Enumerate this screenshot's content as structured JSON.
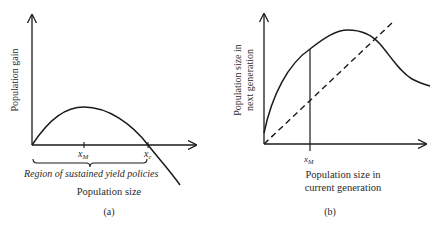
{
  "panel_a": {
    "caption": "(a)",
    "y_axis_label": "Population gain",
    "x_axis_label": "Population size",
    "tick_xm": "x",
    "tick_xm_sub": "M",
    "tick_xc": "x",
    "tick_xc_sub": "c",
    "brace_label": "Region of sustained yield policies"
  },
  "panel_b": {
    "caption": "(b)",
    "y_axis_label_line1": "Population size in",
    "y_axis_label_line2": "next generation",
    "x_axis_label_line1": "Population size in",
    "x_axis_label_line2": "current generation",
    "tick_xm": "x",
    "tick_xm_sub": "M"
  },
  "colors": {
    "line": "#1a1a1a",
    "text": "#2a2a2a",
    "background": "#ffffff"
  }
}
